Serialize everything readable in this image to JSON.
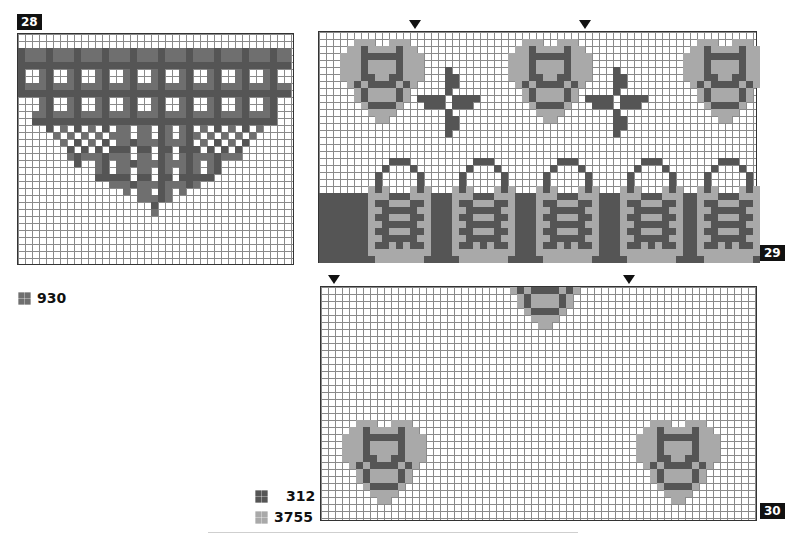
{
  "charts": [
    {
      "id": "28",
      "label": "28",
      "left": 17,
      "top": 33,
      "width": 277,
      "height": 232,
      "badge": {
        "left": 17,
        "top": 14
      },
      "markers": [],
      "pattern_name": "plaid-heart",
      "legend": [
        {
          "code": "930",
          "color": "#6f6f6f"
        }
      ]
    },
    {
      "id": "29",
      "label": "29",
      "left": 318,
      "top": 31,
      "width": 439,
      "height": 232,
      "badge": {
        "left": 760,
        "top": 245
      },
      "markers": [
        415,
        585
      ],
      "pattern_name": "hearts-crosses-baskets-border"
    },
    {
      "id": "30",
      "label": "30",
      "left": 320,
      "top": 286,
      "width": 437,
      "height": 235,
      "badge": {
        "left": 760,
        "top": 503
      },
      "markers": [
        334,
        629
      ],
      "pattern_name": "scattered-hearts",
      "legend": [
        {
          "code": "312",
          "color": "#555555"
        },
        {
          "code": "3755",
          "color": "#a9a9a9"
        }
      ]
    }
  ],
  "legend_28": [
    {
      "code": "930",
      "color": "#6f6f6f"
    }
  ],
  "legend_30": [
    {
      "code": "312",
      "color": "#555555"
    },
    {
      "code": "3755",
      "color": "#a9a9a9"
    }
  ],
  "motifs": {
    "small_heart": [
      "...LLL..LLL...",
      "..LLDLLLLDLL..",
      ".LLLDDDDDDLLL.",
      ".LLLDLLLLDLLL.",
      ".LLLDLLLLDLLL.",
      ".LLLDDLLDDLLL.",
      "..LDLDDDDLDL..",
      "...LDLLLLDL...",
      "...LDLLLLDL...",
      "....LDDDDL....",
      ".....LLLL.....",
      "......LL......"
    ],
    "cross": [
      "....D....",
      "....DD...",
      "....DD...",
      "....D....",
      "DDDD.DDDD",
      ".DDD.DDD.",
      "....D....",
      "....DD...",
      "....DD...",
      "....D...."
    ],
    "basket": [
      "....DDD....",
      "...D...D...",
      "..D.....D..",
      "..D.....D..",
      ".LDL...LDL.",
      ".LLLDDDLLL.",
      ".LDDLLLDDL.",
      ".LLDDDDDLL.",
      ".LDDLLLDDL.",
      ".LLDDDDDLL.",
      ".LDDLLLDDL.",
      ".LLDDDDDLL.",
      ".LDDLDLDDL.",
      ".LLLLLLLLL.",
      "..LLLLLLL.."
    ]
  }
}
